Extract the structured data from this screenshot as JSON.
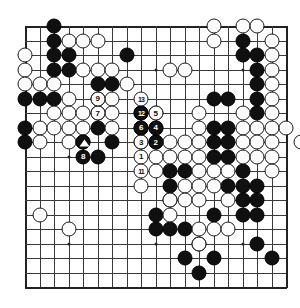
{
  "diagram": {
    "kind": "go-board-diagram",
    "board_size": 19,
    "colors": {
      "black": "#101010",
      "white": "#fdfdfd",
      "line": "#3a3a3a",
      "background": "#ffffff"
    },
    "star_points": [
      [
        4,
        4
      ],
      [
        10,
        4
      ],
      [
        16,
        4
      ],
      [
        4,
        10
      ],
      [
        10,
        10
      ],
      [
        16,
        10
      ],
      [
        4,
        16
      ],
      [
        10,
        16
      ],
      [
        16,
        16
      ]
    ],
    "black_stones": [
      [
        3,
        1
      ],
      [
        3,
        2
      ],
      [
        3,
        3
      ],
      [
        4,
        3
      ],
      [
        8,
        3
      ],
      [
        16,
        2
      ],
      [
        3,
        4
      ],
      [
        4,
        4
      ],
      [
        16,
        3
      ],
      [
        17,
        3
      ],
      [
        17,
        4
      ],
      [
        6,
        5
      ],
      [
        7,
        5
      ],
      [
        17,
        5
      ],
      [
        1,
        6
      ],
      [
        2,
        6
      ],
      [
        3,
        6
      ],
      [
        6,
        6
      ],
      [
        14,
        6
      ],
      [
        15,
        6
      ],
      [
        17,
        6
      ],
      [
        6,
        7
      ],
      [
        9,
        7
      ],
      [
        17,
        7
      ],
      [
        1,
        8
      ],
      [
        6,
        8
      ],
      [
        9,
        8
      ],
      [
        14,
        8
      ],
      [
        15,
        8
      ],
      [
        1,
        9
      ],
      [
        5,
        9
      ],
      [
        7,
        9
      ],
      [
        9,
        9
      ],
      [
        14,
        9
      ],
      [
        15,
        9
      ],
      [
        6,
        10
      ],
      [
        14,
        10
      ],
      [
        15,
        10
      ],
      [
        11,
        11
      ],
      [
        12,
        11
      ],
      [
        16,
        11
      ],
      [
        11,
        12
      ],
      [
        15,
        12
      ],
      [
        16,
        12
      ],
      [
        17,
        12
      ],
      [
        11,
        13
      ],
      [
        16,
        13
      ],
      [
        17,
        13
      ],
      [
        10,
        14
      ],
      [
        14,
        14
      ],
      [
        16,
        14
      ],
      [
        17,
        14
      ],
      [
        10,
        15
      ],
      [
        11,
        15
      ],
      [
        12,
        15
      ],
      [
        13,
        16
      ],
      [
        17,
        16
      ],
      [
        12,
        17
      ],
      [
        14,
        17
      ],
      [
        18,
        17
      ],
      [
        13,
        18
      ]
    ],
    "white_stones": [
      [
        14,
        1
      ],
      [
        16,
        1
      ],
      [
        17,
        1
      ],
      [
        4,
        2
      ],
      [
        5,
        2
      ],
      [
        6,
        2
      ],
      [
        14,
        2
      ],
      [
        18,
        2
      ],
      [
        1,
        3
      ],
      [
        18,
        3
      ],
      [
        1,
        4
      ],
      [
        5,
        4
      ],
      [
        6,
        4
      ],
      [
        7,
        4
      ],
      [
        11,
        4
      ],
      [
        12,
        4
      ],
      [
        18,
        4
      ],
      [
        1,
        5
      ],
      [
        2,
        5
      ],
      [
        3,
        5
      ],
      [
        8,
        5
      ],
      [
        18,
        5
      ],
      [
        4,
        6
      ],
      [
        7,
        6
      ],
      [
        18,
        6
      ],
      [
        3,
        7
      ],
      [
        4,
        7
      ],
      [
        5,
        7
      ],
      [
        7,
        7
      ],
      [
        10,
        7
      ],
      [
        13,
        7
      ],
      [
        16,
        7
      ],
      [
        18,
        7
      ],
      [
        2,
        8
      ],
      [
        3,
        8
      ],
      [
        4,
        8
      ],
      [
        5,
        8
      ],
      [
        7,
        8
      ],
      [
        10,
        8
      ],
      [
        13,
        8
      ],
      [
        16,
        8
      ],
      [
        17,
        8
      ],
      [
        18,
        8
      ],
      [
        19,
        8
      ],
      [
        2,
        9
      ],
      [
        4,
        9
      ],
      [
        10,
        9
      ],
      [
        11,
        9
      ],
      [
        12,
        9
      ],
      [
        13,
        9
      ],
      [
        16,
        9
      ],
      [
        17,
        9
      ],
      [
        18,
        9
      ],
      [
        20,
        9
      ],
      [
        10,
        10
      ],
      [
        11,
        10
      ],
      [
        12,
        10
      ],
      [
        13,
        10
      ],
      [
        16,
        10
      ],
      [
        17,
        10
      ],
      [
        18,
        10
      ],
      [
        10,
        11
      ],
      [
        13,
        11
      ],
      [
        14,
        11
      ],
      [
        15,
        11
      ],
      [
        18,
        11
      ],
      [
        9,
        12
      ],
      [
        12,
        12
      ],
      [
        13,
        12
      ],
      [
        14,
        12
      ],
      [
        11,
        13
      ],
      [
        12,
        13
      ],
      [
        13,
        13
      ],
      [
        15,
        13
      ],
      [
        2,
        14
      ],
      [
        11,
        14
      ],
      [
        4,
        15
      ],
      [
        13,
        15
      ],
      [
        14,
        15
      ],
      [
        15,
        15
      ],
      [
        13,
        16
      ]
    ],
    "numbered_moves": [
      {
        "n": "1",
        "color": "white",
        "x": 9,
        "y": 10
      },
      {
        "n": "2",
        "color": "black",
        "x": 10,
        "y": 9
      },
      {
        "n": "3",
        "color": "white",
        "x": 9,
        "y": 9
      },
      {
        "n": "4",
        "color": "black",
        "x": 10,
        "y": 8
      },
      {
        "n": "5",
        "color": "white",
        "x": 10,
        "y": 7
      },
      {
        "n": "6",
        "color": "black",
        "x": 9,
        "y": 8
      },
      {
        "n": "7",
        "color": "white",
        "x": 6,
        "y": 7
      },
      {
        "n": "8",
        "color": "black",
        "x": 5,
        "y": 10
      },
      {
        "n": "9",
        "color": "white",
        "x": 6,
        "y": 6
      },
      {
        "n": "11",
        "color": "white",
        "x": 9,
        "y": 11
      },
      {
        "n": "12",
        "color": "black",
        "x": 9,
        "y": 7
      },
      {
        "n": "13",
        "color": "white",
        "x": 9,
        "y": 6
      }
    ],
    "marked_stones": [
      {
        "mark": "triangle",
        "color": "black",
        "x": 5,
        "y": 9
      }
    ]
  }
}
